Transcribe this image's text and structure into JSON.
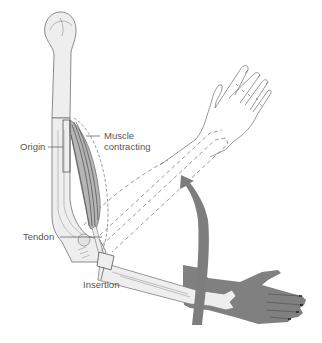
{
  "figure": {
    "labels": {
      "origin": "Origin",
      "muscle_line1": "Muscle",
      "muscle_line2": "contracting",
      "tendon": "Tendon",
      "insertion": "Insertion"
    },
    "colors": {
      "background": "#ffffff",
      "outline": "#6e6e6e",
      "bone_fill": "#eeeeee",
      "muscle_fill": "#b5b5b5",
      "muscle_fibers": "#555555",
      "arrow_fill": "#7d7d7d",
      "lowered_arm_fill": "#808080",
      "label_text": "#555555"
    }
  }
}
